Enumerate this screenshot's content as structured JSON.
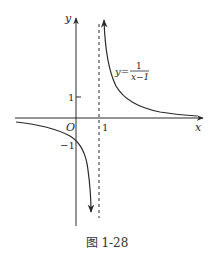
{
  "figure": {
    "caption": "图 1-28",
    "axes": {
      "x_label": "x",
      "y_label": "y",
      "origin_label": "O"
    },
    "ticks": {
      "x_one": "1",
      "y_one": "1",
      "y_neg_one": "−1"
    },
    "function_label": {
      "lhs": "y=",
      "numerator": "1",
      "denominator": "x−1"
    },
    "asymptote": "x = 1 (dashed vertical line)",
    "colors": {
      "line": "#2a2a2a",
      "background": "#ffffff"
    }
  }
}
